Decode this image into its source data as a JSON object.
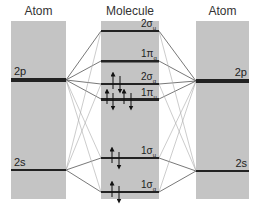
{
  "headers": {
    "left": "Atom",
    "middle": "Molecule",
    "right": "Atom"
  },
  "atomic_levels": {
    "p": "2p",
    "s": "2s"
  },
  "molecular_orbitals": [
    {
      "label": "2σ",
      "sub": "u",
      "y": 31
    },
    {
      "label": "1π",
      "sub": "g",
      "y": 61
    },
    {
      "label": "2σ",
      "sub": "g",
      "y": 84
    },
    {
      "label": "1π",
      "sub": "u",
      "y": 99
    },
    {
      "label": "1σ",
      "sub": "u",
      "y": 158
    },
    {
      "label": "1σ",
      "sub": "g",
      "y": 192
    }
  ],
  "colors": {
    "panel": "#c4c4c4",
    "level": "#222222",
    "line": "#555555",
    "faint": "#aaaaaa"
  }
}
